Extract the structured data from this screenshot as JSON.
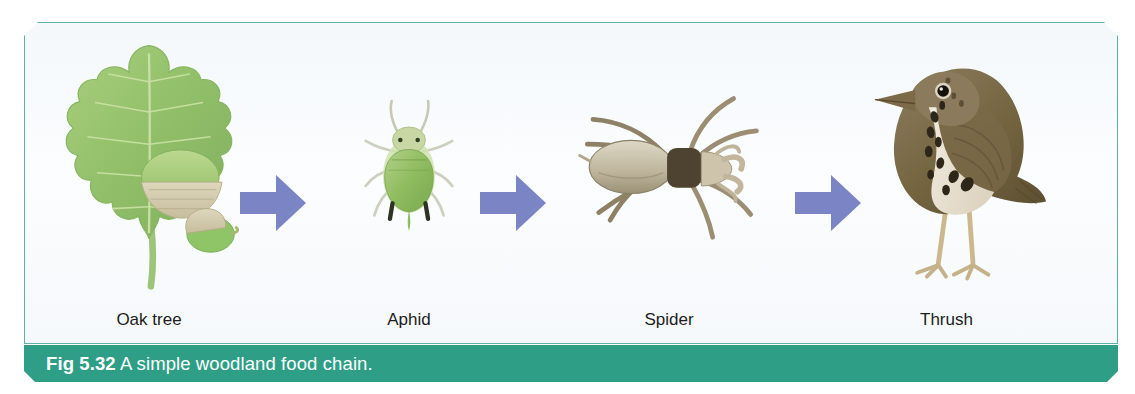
{
  "figure": {
    "caption_number": "Fig 5.32",
    "caption_text": " A simple woodland food chain.",
    "caption_bar_color": "#2f9e86",
    "frame_border_color": "#5bb3a8",
    "panel_background": "#f7fafc",
    "arrow_color": "#7b84c4"
  },
  "chain": {
    "organisms": [
      {
        "label": "Oak tree",
        "icon": "oak-leaf-acorn-illustration"
      },
      {
        "label": "Aphid",
        "icon": "aphid-illustration"
      },
      {
        "label": "Spider",
        "icon": "spider-illustration"
      },
      {
        "label": "Thrush",
        "icon": "thrush-bird-illustration"
      }
    ],
    "arrows": [
      {
        "name": "arrow-oak-to-aphid",
        "direction": "right"
      },
      {
        "name": "arrow-aphid-to-spider",
        "direction": "right"
      },
      {
        "name": "arrow-spider-to-thrush",
        "direction": "right"
      }
    ]
  }
}
